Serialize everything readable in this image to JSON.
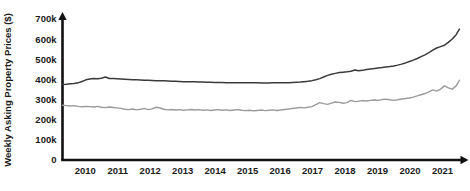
{
  "chart_data": {
    "type": "line",
    "title": "",
    "xlabel": "",
    "ylabel": "Weekly Asking Property Prices ($)",
    "ylim": [
      0,
      700000
    ],
    "xlim": [
      2009.3,
      2021.6
    ],
    "grid": false,
    "legend": "none",
    "y_ticks": [
      {
        "value": 0,
        "label": "0"
      },
      {
        "value": 100000,
        "label": "100k"
      },
      {
        "value": 200000,
        "label": "200k"
      },
      {
        "value": 300000,
        "label": "300k"
      },
      {
        "value": 400000,
        "label": "400k"
      },
      {
        "value": 500000,
        "label": "500k"
      },
      {
        "value": 600000,
        "label": "600k"
      },
      {
        "value": 700000,
        "label": "700k"
      }
    ],
    "x_ticks": [
      {
        "value": 2010,
        "label": "2010"
      },
      {
        "value": 2011,
        "label": "2011"
      },
      {
        "value": 2012,
        "label": "2012"
      },
      {
        "value": 2013,
        "label": "2013"
      },
      {
        "value": 2014,
        "label": "2014"
      },
      {
        "value": 2015,
        "label": "2015"
      },
      {
        "value": 2016,
        "label": "2016"
      },
      {
        "value": 2017,
        "label": "2017"
      },
      {
        "value": 2018,
        "label": "2018"
      },
      {
        "value": 2019,
        "label": "2019"
      },
      {
        "value": 2020,
        "label": "2020"
      },
      {
        "value": 2021,
        "label": "2021"
      }
    ],
    "series": [
      {
        "name": "upper-series",
        "color": "#3a3a3a",
        "width": 1.5,
        "x": [
          2009.3,
          2009.42,
          2009.54,
          2009.66,
          2009.78,
          2009.9,
          2010.02,
          2010.14,
          2010.26,
          2010.38,
          2010.5,
          2010.62,
          2010.74,
          2010.86,
          2010.98,
          2011.1,
          2011.22,
          2011.34,
          2011.46,
          2011.58,
          2011.7,
          2011.82,
          2011.94,
          2012.06,
          2012.18,
          2012.3,
          2012.42,
          2012.54,
          2012.66,
          2012.78,
          2012.9,
          2013.02,
          2013.14,
          2013.26,
          2013.38,
          2013.5,
          2013.62,
          2013.74,
          2013.86,
          2013.98,
          2014.1,
          2014.22,
          2014.34,
          2014.46,
          2014.58,
          2014.7,
          2014.82,
          2014.94,
          2015.06,
          2015.18,
          2015.3,
          2015.42,
          2015.54,
          2015.66,
          2015.78,
          2015.9,
          2016.02,
          2016.14,
          2016.26,
          2016.38,
          2016.5,
          2016.62,
          2016.74,
          2016.86,
          2016.98,
          2017.1,
          2017.22,
          2017.34,
          2017.46,
          2017.58,
          2017.7,
          2017.82,
          2017.94,
          2018.06,
          2018.18,
          2018.3,
          2018.42,
          2018.54,
          2018.66,
          2018.78,
          2018.9,
          2019.02,
          2019.14,
          2019.26,
          2019.38,
          2019.5,
          2019.62,
          2019.74,
          2019.86,
          2019.98,
          2020.1,
          2020.22,
          2020.34,
          2020.46,
          2020.58,
          2020.7,
          2020.82,
          2020.94,
          2021.06,
          2021.18,
          2021.3,
          2021.42,
          2021.52
        ],
        "values": [
          375000,
          376000,
          378000,
          380000,
          383000,
          390000,
          398000,
          402000,
          404000,
          403000,
          406000,
          412000,
          405000,
          404000,
          403000,
          402000,
          401000,
          400000,
          399000,
          398000,
          397000,
          396000,
          396000,
          395000,
          394000,
          393000,
          393000,
          392000,
          391000,
          391000,
          390000,
          389000,
          389000,
          388000,
          388000,
          387000,
          387000,
          386000,
          386000,
          385000,
          385000,
          385000,
          384000,
          384000,
          384000,
          383000,
          383000,
          383000,
          383000,
          383000,
          383000,
          382000,
          382000,
          382000,
          383000,
          383000,
          383000,
          384000,
          384000,
          385000,
          386000,
          387000,
          389000,
          391000,
          394000,
          398000,
          404000,
          412000,
          420000,
          426000,
          430000,
          434000,
          436000,
          438000,
          441000,
          447000,
          443000,
          445000,
          449000,
          452000,
          454000,
          457000,
          459000,
          462000,
          464000,
          467000,
          471000,
          476000,
          482000,
          489000,
          496000,
          504000,
          513000,
          522000,
          533000,
          545000,
          556000,
          563000,
          570000,
          584000,
          601000,
          622000,
          650000
        ]
      },
      {
        "name": "lower-series",
        "color": "#9a9a9a",
        "width": 1.4,
        "x": [
          2009.3,
          2009.42,
          2009.54,
          2009.66,
          2009.78,
          2009.9,
          2010.02,
          2010.14,
          2010.26,
          2010.38,
          2010.5,
          2010.62,
          2010.74,
          2010.86,
          2010.98,
          2011.1,
          2011.22,
          2011.34,
          2011.46,
          2011.58,
          2011.7,
          2011.82,
          2011.94,
          2012.06,
          2012.18,
          2012.3,
          2012.42,
          2012.54,
          2012.66,
          2012.78,
          2012.9,
          2013.02,
          2013.14,
          2013.26,
          2013.38,
          2013.5,
          2013.62,
          2013.74,
          2013.86,
          2013.98,
          2014.1,
          2014.22,
          2014.34,
          2014.46,
          2014.58,
          2014.7,
          2014.82,
          2014.94,
          2015.06,
          2015.18,
          2015.3,
          2015.42,
          2015.54,
          2015.66,
          2015.78,
          2015.9,
          2016.02,
          2016.14,
          2016.26,
          2016.38,
          2016.5,
          2016.62,
          2016.74,
          2016.86,
          2016.98,
          2017.1,
          2017.22,
          2017.34,
          2017.46,
          2017.58,
          2017.7,
          2017.82,
          2017.94,
          2018.06,
          2018.18,
          2018.3,
          2018.42,
          2018.54,
          2018.66,
          2018.78,
          2018.9,
          2019.02,
          2019.14,
          2019.26,
          2019.38,
          2019.5,
          2019.62,
          2019.74,
          2019.86,
          2019.98,
          2020.1,
          2020.22,
          2020.34,
          2020.46,
          2020.58,
          2020.7,
          2020.82,
          2020.94,
          2021.06,
          2021.18,
          2021.3,
          2021.42,
          2021.52
        ],
        "values": [
          272000,
          270000,
          268000,
          270000,
          266000,
          264000,
          266000,
          265000,
          263000,
          266000,
          262000,
          260000,
          263000,
          261000,
          259000,
          256000,
          252000,
          250000,
          253000,
          249000,
          252000,
          256000,
          250000,
          254000,
          262000,
          258000,
          252000,
          249000,
          251000,
          248000,
          250000,
          247000,
          249000,
          251000,
          248000,
          250000,
          247000,
          249000,
          246000,
          248000,
          250000,
          247000,
          249000,
          246000,
          248000,
          250000,
          247000,
          245000,
          247000,
          244000,
          246000,
          248000,
          245000,
          247000,
          249000,
          246000,
          248000,
          251000,
          253000,
          256000,
          258000,
          261000,
          259000,
          262000,
          265000,
          275000,
          285000,
          280000,
          276000,
          282000,
          288000,
          286000,
          282000,
          285000,
          296000,
          290000,
          292000,
          295000,
          293000,
          296000,
          298000,
          296000,
          300000,
          302000,
          299000,
          296000,
          299000,
          303000,
          305000,
          308000,
          312000,
          318000,
          324000,
          330000,
          338000,
          348000,
          342000,
          352000,
          368000,
          358000,
          352000,
          368000,
          396000
        ]
      }
    ]
  }
}
